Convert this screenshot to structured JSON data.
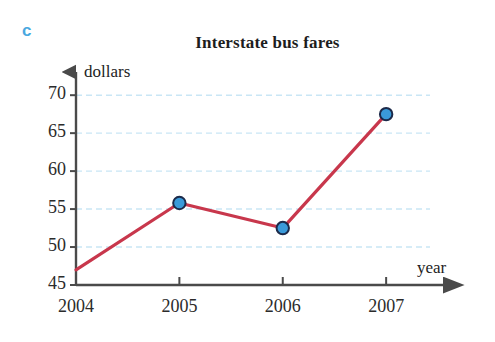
{
  "panel": {
    "letter": "c",
    "color": "#4aa8e0"
  },
  "chart_data": {
    "type": "line",
    "title": "Interstate bus fares",
    "xlabel": "year",
    "ylabel": "dollars",
    "categories": [
      "2004",
      "2005",
      "2006",
      "2007"
    ],
    "x": [
      2004,
      2005,
      2006,
      2007
    ],
    "values": [
      47,
      55.8,
      52.5,
      67.5
    ],
    "markers": [
      false,
      true,
      true,
      true
    ],
    "series": [
      {
        "name": "Interstate bus fares",
        "values": [
          47,
          55.8,
          52.5,
          67.5
        ],
        "line_color": "#c8374c",
        "marker_fill": "#3a9ad9",
        "marker_edge": "#1c2a4a"
      }
    ],
    "ylim": [
      45,
      72
    ],
    "xlim": [
      2004,
      2007.55
    ],
    "yticks": [
      45,
      50,
      55,
      60,
      65,
      70
    ],
    "ytick_labels": [
      "45",
      "50",
      "55",
      "60",
      "65",
      "70"
    ],
    "xticks": [
      2004,
      2005,
      2006,
      2007
    ],
    "xtick_labels": [
      "2004",
      "2005",
      "2006",
      "2007"
    ],
    "grid": true,
    "grid_axis": "y",
    "grid_style": "dashed",
    "grid_color": "#c9e6f5",
    "legend": null,
    "axis_arrows": true
  },
  "axis_colors": {
    "axis_line": "#4a4a4a",
    "grid": "#c9e6f5",
    "text": "#2b2b2b"
  }
}
